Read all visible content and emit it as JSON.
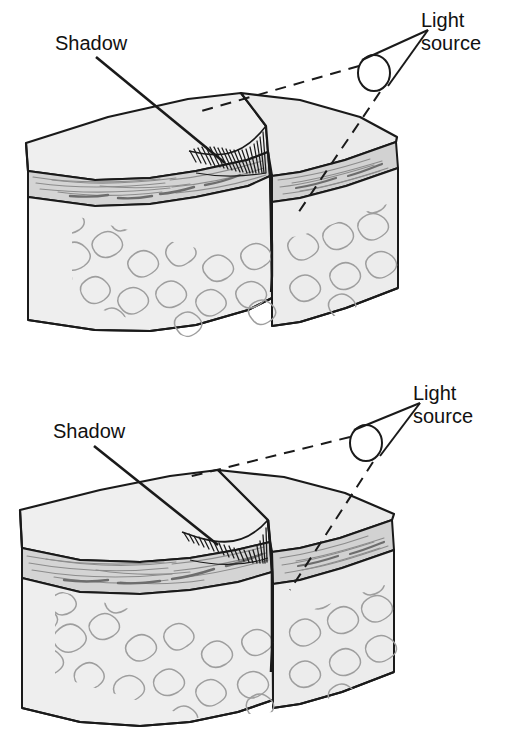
{
  "figure": {
    "background_color": "#ffffff",
    "line_color": "#1a1a1a",
    "text_color": "#111111"
  },
  "palette": {
    "top_surface": "#efefef",
    "top_surface_light": "#f7f7f7",
    "front_face": "#ededed",
    "side_face": "#e6e6e6",
    "sediment_band": "#d4d4d4",
    "sediment_band_dark": "#c4c4c4",
    "basement_texture": "#9a9a9a",
    "outline": "#1a1a1a",
    "shadow_hachure": "#1a1a1a",
    "ray_dash": "#1a1a1a"
  },
  "panels": [
    {
      "id": "upper",
      "name": "high-sun-angle-block",
      "shadow_label": "Shadow",
      "light_source_label_line1": "Light",
      "light_source_label_line2": "source",
      "scarp_description": "Broad gentle fault scarp with wide shadow",
      "shadow_width": "wide",
      "layers": [
        {
          "name": "surface-regolith",
          "fill": "#efefef"
        },
        {
          "name": "sedimentary-strata",
          "fill": "#d4d4d4"
        },
        {
          "name": "crystalline-basement",
          "fill": "#ededed"
        }
      ]
    },
    {
      "id": "lower",
      "name": "low-sun-angle-block",
      "shadow_label": "Shadow",
      "light_source_label_line1": "Light",
      "light_source_label_line2": "source",
      "scarp_description": "Narrow steep fault scarp with narrow shadow",
      "shadow_width": "narrow",
      "layers": [
        {
          "name": "surface-regolith",
          "fill": "#efefef"
        },
        {
          "name": "sedimentary-strata",
          "fill": "#d4d4d4"
        },
        {
          "name": "crystalline-basement",
          "fill": "#ededed"
        }
      ]
    }
  ]
}
